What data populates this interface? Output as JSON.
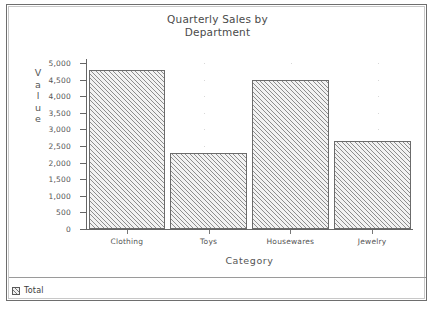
{
  "chart_data": {
    "type": "bar",
    "title": "Quarterly Sales by Department",
    "title_lines": [
      "Quarterly Sales by",
      "Department"
    ],
    "xlabel": "Category",
    "ylabel": "Value",
    "categories": [
      "Clothing",
      "Toys",
      "Housewares",
      "Jewelry"
    ],
    "values": [
      4800,
      2300,
      4500,
      2650
    ],
    "series": [
      {
        "name": "Total",
        "values": [
          4800,
          2300,
          4500,
          2650
        ]
      }
    ],
    "ylim": [
      0,
      5000
    ],
    "ytick_step": 500,
    "ytick_labels": [
      "5,000",
      "4,500",
      "4,000",
      "3,500",
      "3,000",
      "2,500",
      "2,000",
      "1,500",
      "1,000",
      "500",
      "0"
    ],
    "ytick_values": [
      5000,
      4500,
      4000,
      3500,
      3000,
      2500,
      2000,
      1500,
      1000,
      500,
      0
    ],
    "grid": false,
    "legend": {
      "position": "bottom-left",
      "entries": [
        "Total"
      ]
    },
    "colors": {
      "bar_fill": "#f2f2f2",
      "bar_hatch": "#8d8d8d",
      "bar_border": "#6b6b6b",
      "axis": "#666666",
      "text": "#555555",
      "background": "#ffffff",
      "window_border": "#6e6e6e"
    }
  },
  "legend": {
    "swatch_name": "hatched-swatch-icon",
    "label": "Total"
  }
}
